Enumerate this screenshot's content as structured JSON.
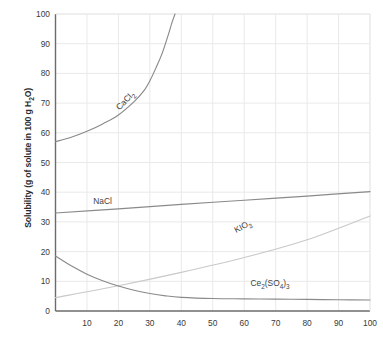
{
  "chart_data": {
    "type": "line",
    "title": "",
    "xlabel": "",
    "ylabel": "Solubility (g of solute in 100 g H2O)",
    "ylabel_parts": {
      "pre": "Solubility (g of solute in 100 g H",
      "sub": "2",
      "post": "O)"
    },
    "xlim": [
      0,
      100
    ],
    "ylim": [
      0,
      100
    ],
    "grid": true,
    "legend": "inline-curve-labels",
    "xticks": [
      0,
      10,
      20,
      30,
      40,
      50,
      60,
      70,
      80,
      90,
      100
    ],
    "yticks": [
      0,
      10,
      20,
      30,
      40,
      50,
      60,
      70,
      80,
      90,
      100
    ],
    "series": [
      {
        "name": "CaCl2",
        "label_parts": {
          "pre": "CaCl",
          "sub": "2",
          "post": ""
        },
        "color": "#8a8a8a",
        "label_x": 20,
        "label_y": 68,
        "label_rotation": -46,
        "x": [
          0,
          5,
          10,
          15,
          20,
          25,
          28,
          30,
          32,
          34,
          36,
          37,
          38
        ],
        "y": [
          57,
          58.5,
          60.5,
          63,
          66,
          70.5,
          74,
          77.5,
          82,
          87,
          93.5,
          97,
          100
        ]
      },
      {
        "name": "NaCl",
        "label_parts": {
          "pre": "NaCl",
          "sub": "",
          "post": ""
        },
        "color": "#8a8a8a",
        "label_x": 12,
        "label_y": 37,
        "label_rotation": 0,
        "x": [
          0,
          20,
          40,
          60,
          80,
          100
        ],
        "y": [
          33,
          34.4,
          35.9,
          37.3,
          38.7,
          40.2
        ]
      },
      {
        "name": "KIO3",
        "label_parts": {
          "pre": "KIO",
          "sub": "3",
          "post": ""
        },
        "color": "#c9c9c9",
        "label_x": 57,
        "label_y": 27,
        "label_rotation": -27,
        "x": [
          0,
          20,
          40,
          60,
          80,
          100
        ],
        "y": [
          4.5,
          8.5,
          13,
          18,
          24,
          32
        ]
      },
      {
        "name": "Ce2(SO4)3",
        "label_parts": {
          "pre": "Ce",
          "sub": "2",
          "post": "(SO",
          "sub2": "4",
          "post2": ")",
          "sub3": "3"
        },
        "color": "#8a8a8a",
        "label_x": 62,
        "label_y": 9,
        "label_rotation": 0,
        "x": [
          0,
          5,
          10,
          15,
          20,
          25,
          30,
          35,
          40,
          50,
          60,
          70,
          80,
          90,
          100
        ],
        "y": [
          18.5,
          15.2,
          12.4,
          10.2,
          8.4,
          7.0,
          5.9,
          5.1,
          4.6,
          4.2,
          4.1,
          4.0,
          3.9,
          3.8,
          3.7
        ]
      }
    ]
  },
  "axes": {
    "axis_color": "#6b6b6b",
    "grid_color": "#e9e9e9",
    "background": "#ffffff"
  }
}
